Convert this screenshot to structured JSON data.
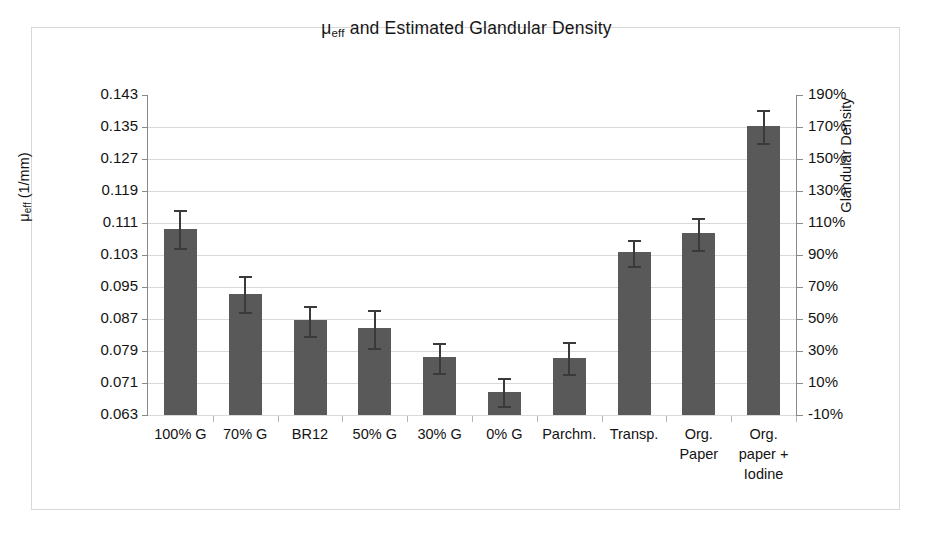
{
  "chart_data": {
    "type": "bar",
    "title": "μeff and Estimated Glandular Density",
    "title_main": "μ",
    "title_sub": "eff",
    "title_rest": " and Estimated Glandular Density",
    "xlabel": "",
    "ylabel": "μeff (1/mm)",
    "ylabel_main": "μ",
    "ylabel_sub": "eff",
    "ylabel_rest": " (1/mm)",
    "y2label": "Glandular Density",
    "grid": true,
    "legend": "none",
    "bar_color": "#595959",
    "error_color": "#3a3a3a",
    "gridline_color": "#d9d9d9",
    "axis_color": "#8a8a8a",
    "ylim": [
      0.063,
      0.143
    ],
    "ytick_step": 0.008,
    "yticks": [
      0.143,
      0.135,
      0.127,
      0.119,
      0.111,
      0.103,
      0.095,
      0.087,
      0.079,
      0.071,
      0.063
    ],
    "ytick_labels": [
      "0.143",
      "0.135",
      "0.127",
      "0.119",
      "0.111",
      "0.103",
      "0.095",
      "0.087",
      "0.079",
      "0.071",
      "0.063"
    ],
    "y2lim": [
      -10,
      190
    ],
    "y2tick_step": 20,
    "y2ticks": [
      190,
      170,
      150,
      130,
      110,
      90,
      70,
      50,
      30,
      10,
      -10
    ],
    "y2tick_labels": [
      "190%",
      "170%",
      "150%",
      "130%",
      "110%",
      "90%",
      "70%",
      "50%",
      "30%",
      "10%",
      "-10%"
    ],
    "categories": [
      "100% G",
      "70% G",
      "BR12",
      "50% G",
      "30% G",
      "0% G",
      "Parchm.",
      "Transp.",
      "Org. Paper",
      "Org. paper + Iodine"
    ],
    "category_lines": [
      [
        "100% G"
      ],
      [
        "70% G"
      ],
      [
        "BR12"
      ],
      [
        "50% G"
      ],
      [
        "30% G"
      ],
      [
        "0% G"
      ],
      [
        "Parchm."
      ],
      [
        "Transp."
      ],
      [
        "Org.",
        "Paper"
      ],
      [
        "Org.",
        "paper +",
        "Iodine"
      ]
    ],
    "values": [
      0.1095,
      0.0933,
      0.0868,
      0.0848,
      0.0775,
      0.0688,
      0.0773,
      0.1037,
      0.1085,
      0.1352
    ],
    "error_upper": [
      0.0048,
      0.0045,
      0.0035,
      0.0045,
      0.0035,
      0.0035,
      0.004,
      0.003,
      0.0038,
      0.004
    ],
    "error_lower": [
      0.0048,
      0.0045,
      0.004,
      0.005,
      0.004,
      0.0035,
      0.004,
      0.0035,
      0.0043,
      0.0043
    ],
    "series": [
      {
        "name": "μeff",
        "values": [
          0.1095,
          0.0933,
          0.0868,
          0.0848,
          0.0775,
          0.0688,
          0.0773,
          0.1037,
          0.1085,
          0.1352
        ]
      }
    ]
  }
}
